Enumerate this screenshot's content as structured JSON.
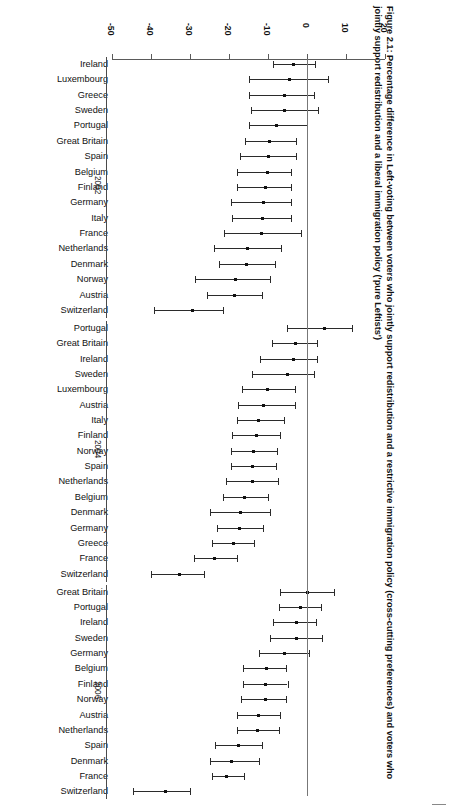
{
  "figure": {
    "caption": "Figure 2.1: Percentage difference in Left-voting between voters who jointly support redistribution and a restrictive immigration policy (cross-cutting preferences) and voters who jointly support redistribution and a liberal immigration policy ('pure Leftists')",
    "orientation": "rotated-90-clockwise",
    "colors": {
      "axis": "#5a5a5a",
      "zero_line": "#777777",
      "marker": "#111111",
      "interval": "#2b2b2b",
      "text": "#111111",
      "background": "#ffffff"
    }
  },
  "chart_data": {
    "type": "scatter",
    "subtype": "forest-plot-with-error-bars",
    "title": "Figure 2.1: Percentage difference in Left-voting between voters who jointly support redistribution and a restrictive immigration policy (cross-cutting preferences) and voters who jointly support redistribution and a liberal immigration policy ('pure Leftists')",
    "xlabel": "",
    "ylabel": "",
    "xlim": [
      -50,
      20
    ],
    "xticks": [
      -50,
      -40,
      -30,
      -20,
      -10,
      0,
      10,
      20
    ],
    "xticklabels": [
      "-50",
      "-40",
      "-30",
      "-20",
      "-10",
      "0",
      "10",
      "20"
    ],
    "grid": false,
    "legend": null,
    "reference_line": 0,
    "groups": [
      {
        "label": "2002",
        "points": [
          {
            "category": "Ireland",
            "value": -3.5,
            "low": -8.8,
            "high": 2.0
          },
          {
            "category": "Luxembourg",
            "value": -4.6,
            "low": -15.0,
            "high": 5.4
          },
          {
            "category": "Greece",
            "value": -5.7,
            "low": -15.0,
            "high": 1.7
          },
          {
            "category": "Sweden",
            "value": -5.8,
            "low": -14.4,
            "high": 2.8
          },
          {
            "category": "Portugal",
            "value": -7.9,
            "low": -15.0,
            "high": 0.0
          },
          {
            "category": "Great Britain",
            "value": -9.6,
            "low": -15.9,
            "high": -2.7
          },
          {
            "category": "Spain",
            "value": -9.9,
            "low": -17.2,
            "high": -2.8
          },
          {
            "category": "Belgium",
            "value": -10.2,
            "low": -18.0,
            "high": -4.0
          },
          {
            "category": "Finland",
            "value": -10.7,
            "low": -18.0,
            "high": -4.0
          },
          {
            "category": "Germany",
            "value": -11.2,
            "low": -19.4,
            "high": -4.1
          },
          {
            "category": "Italy",
            "value": -11.4,
            "low": -19.2,
            "high": -4.2
          },
          {
            "category": "France",
            "value": -11.6,
            "low": -21.3,
            "high": -1.6
          },
          {
            "category": "Netherlands",
            "value": -15.2,
            "low": -23.8,
            "high": -6.7
          },
          {
            "category": "Denmark",
            "value": -15.4,
            "low": -22.5,
            "high": -8.2
          },
          {
            "category": "Norway",
            "value": -18.4,
            "low": -28.7,
            "high": -9.4
          },
          {
            "category": "Austria",
            "value": -18.5,
            "low": -25.7,
            "high": -11.6
          },
          {
            "category": "Switzerland",
            "value": -29.4,
            "low": -39.2,
            "high": -21.6
          }
        ]
      },
      {
        "label": "2004",
        "points": [
          {
            "category": "Portugal",
            "value": 4.4,
            "low": -5.2,
            "high": 11.6
          },
          {
            "category": "Great Britain",
            "value": -2.9,
            "low": -9.0,
            "high": 2.6
          },
          {
            "category": "Ireland",
            "value": -3.4,
            "low": -12.1,
            "high": 2.6
          },
          {
            "category": "Sweden",
            "value": -4.9,
            "low": -14.1,
            "high": 1.8
          },
          {
            "category": "Luxembourg",
            "value": -10.2,
            "low": -16.6,
            "high": -3.1
          },
          {
            "category": "Austria",
            "value": -11.2,
            "low": -17.8,
            "high": -3.1
          },
          {
            "category": "Italy",
            "value": -12.5,
            "low": -18.0,
            "high": -5.8
          },
          {
            "category": "Finland",
            "value": -13.0,
            "low": -19.3,
            "high": -6.8
          },
          {
            "category": "Norway",
            "value": -13.6,
            "low": -19.4,
            "high": -7.6
          },
          {
            "category": "Spain",
            "value": -13.9,
            "low": -19.4,
            "high": -8.0
          },
          {
            "category": "Netherlands",
            "value": -14.0,
            "low": -20.7,
            "high": -7.5
          },
          {
            "category": "Belgium",
            "value": -16.0,
            "low": -21.6,
            "high": -10.0
          },
          {
            "category": "Denmark",
            "value": -17.0,
            "low": -24.9,
            "high": -9.6
          },
          {
            "category": "Germany",
            "value": -17.2,
            "low": -23.1,
            "high": -11.4
          },
          {
            "category": "Greece",
            "value": -18.8,
            "low": -24.4,
            "high": -13.6
          },
          {
            "category": "France",
            "value": -23.6,
            "low": -29.0,
            "high": -17.9
          },
          {
            "category": "Switzerland",
            "value": -32.8,
            "low": -40.0,
            "high": -26.5
          }
        ]
      },
      {
        "label": "2006",
        "points": [
          {
            "category": "Great Britain",
            "value": 0.0,
            "low": -6.8,
            "high": 6.8
          },
          {
            "category": "Portugal",
            "value": -1.6,
            "low": -7.2,
            "high": 3.6
          },
          {
            "category": "Ireland",
            "value": -2.6,
            "low": -8.6,
            "high": 2.4
          },
          {
            "category": "Sweden",
            "value": -2.8,
            "low": -9.4,
            "high": 3.8
          },
          {
            "category": "Germany",
            "value": -5.8,
            "low": -12.2,
            "high": 0.4
          },
          {
            "category": "Belgium",
            "value": -10.5,
            "low": -16.4,
            "high": -5.5
          },
          {
            "category": "Finland",
            "value": -10.7,
            "low": -16.4,
            "high": -5.0
          },
          {
            "category": "Norway",
            "value": -10.6,
            "low": -16.8,
            "high": -5.5
          },
          {
            "category": "Austria",
            "value": -12.4,
            "low": -17.9,
            "high": -6.9
          },
          {
            "category": "Netherlands",
            "value": -12.6,
            "low": -18.0,
            "high": -7.2
          },
          {
            "category": "Spain",
            "value": -17.6,
            "low": -23.6,
            "high": -11.6
          },
          {
            "category": "Denmark",
            "value": -19.4,
            "low": -25.0,
            "high": -12.4
          },
          {
            "category": "France",
            "value": -20.6,
            "low": -24.4,
            "high": -16.2
          },
          {
            "category": "Switzerland",
            "value": -36.2,
            "low": -44.6,
            "high": -30.0
          }
        ]
      }
    ]
  }
}
